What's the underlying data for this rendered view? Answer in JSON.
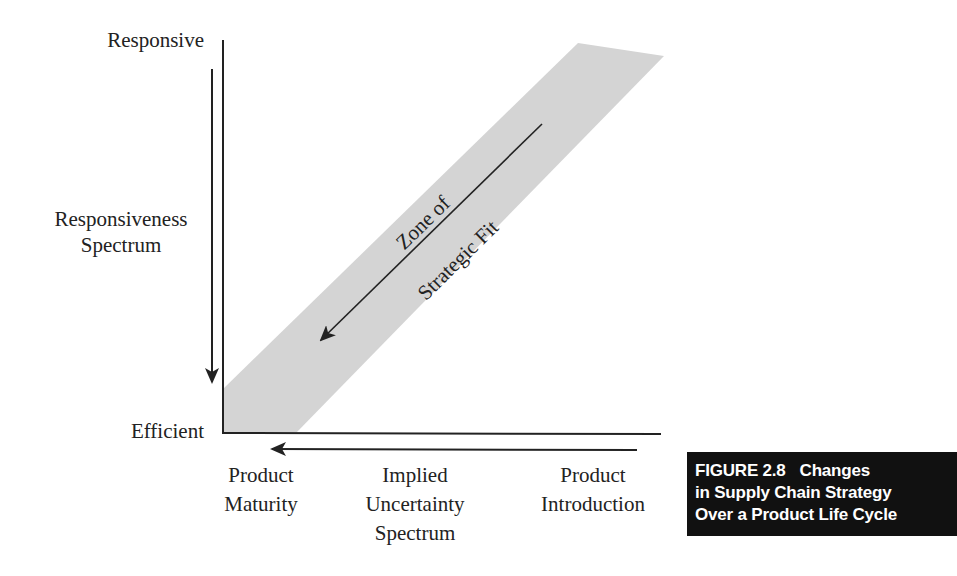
{
  "diagram": {
    "y_axis": {
      "top_label": "Responsive",
      "bottom_label": "Efficient",
      "spectrum_label_line1": "Responsiveness",
      "spectrum_label_line2": "Spectrum",
      "arrow_direction": "down"
    },
    "x_axis": {
      "left_label_line1": "Product",
      "left_label_line2": "Maturity",
      "center_label_line1": "Implied",
      "center_label_line2": "Uncertainty",
      "center_label_line3": "Spectrum",
      "right_label_line1": "Product",
      "right_label_line2": "Introduction",
      "arrow_direction": "left"
    },
    "band": {
      "label_line1": "Zone of",
      "label_line2": "Strategic Fit",
      "fill_color": "#d4d4d4",
      "arrow_direction": "down-left"
    },
    "colors": {
      "axis": "#222222",
      "caption_bg": "#111111",
      "caption_text": "#ffffff"
    }
  },
  "caption": {
    "figure_number": "FIGURE 2.8",
    "title_part1": "Changes",
    "title_line2": "in Supply Chain Strategy",
    "title_line3": "Over a Product Life Cycle"
  }
}
